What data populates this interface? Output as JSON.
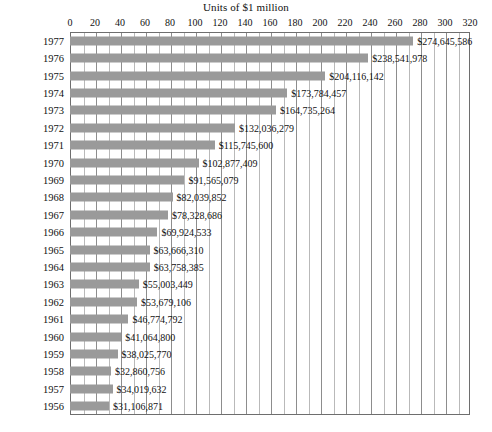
{
  "chart_data": {
    "type": "bar",
    "orientation": "horizontal",
    "title": "Units of $1 million",
    "xlabel": "",
    "ylabel": "",
    "xlim": [
      0,
      320
    ],
    "xticks": [
      0,
      20,
      40,
      60,
      80,
      100,
      120,
      140,
      160,
      180,
      200,
      220,
      240,
      260,
      280,
      300,
      320
    ],
    "minor_tick_step": 10,
    "grid": true,
    "legend": "none",
    "bar_color": "#9a9a9a",
    "categories": [
      "1977",
      "1976",
      "1975",
      "1974",
      "1973",
      "1972",
      "1971",
      "1970",
      "1969",
      "1968",
      "1967",
      "1966",
      "1965",
      "1964",
      "1963",
      "1962",
      "1961",
      "1960",
      "1959",
      "1958",
      "1957",
      "1956"
    ],
    "values": [
      274.645586,
      238.541978,
      204.116142,
      173.784457,
      164.735264,
      132.036279,
      115.7456,
      102.877409,
      91.565079,
      82.039852,
      78.328686,
      69.924533,
      63.66631,
      63.758385,
      55.003449,
      53.679106,
      46.774792,
      41.0648,
      38.02577,
      32.860756,
      34.019632,
      31.106871
    ],
    "data_labels": [
      "$274,645,586",
      "$238,541,978",
      "$204,116,142",
      "$173,784,457",
      "$164,735,264",
      "$132,036,279",
      "$115,745,600",
      "$102,877,409",
      "$91,565,079",
      "$82,039,852",
      "$78,328,686",
      "$69,924,533",
      "$63,666,310",
      "$63,758,385",
      "$55,003,449",
      "$53,679,106",
      "$46,774,792",
      "$41,064,800",
      "$38,025,770",
      "$32,860,756",
      "$34,019,632",
      "$31,106,871"
    ],
    "rows": [
      {
        "year": "1977",
        "value": 274.645586,
        "label": "$274,645,586"
      },
      {
        "year": "1976",
        "value": 238.541978,
        "label": "$238,541,978"
      },
      {
        "year": "1975",
        "value": 204.116142,
        "label": "$204,116,142"
      },
      {
        "year": "1974",
        "value": 173.784457,
        "label": "$173,784,457"
      },
      {
        "year": "1973",
        "value": 164.735264,
        "label": "$164,735,264"
      },
      {
        "year": "1972",
        "value": 132.036279,
        "label": "$132,036,279"
      },
      {
        "year": "1971",
        "value": 115.7456,
        "label": "$115,745,600"
      },
      {
        "year": "1970",
        "value": 102.877409,
        "label": "$102,877,409"
      },
      {
        "year": "1969",
        "value": 91.565079,
        "label": "$91,565,079"
      },
      {
        "year": "1968",
        "value": 82.039852,
        "label": "$82,039,852"
      },
      {
        "year": "1967",
        "value": 78.328686,
        "label": "$78,328,686"
      },
      {
        "year": "1966",
        "value": 69.924533,
        "label": "$69,924,533"
      },
      {
        "year": "1965",
        "value": 63.66631,
        "label": "$63,666,310"
      },
      {
        "year": "1964",
        "value": 63.758385,
        "label": "$63,758,385"
      },
      {
        "year": "1963",
        "value": 55.003449,
        "label": "$55,003,449"
      },
      {
        "year": "1962",
        "value": 53.679106,
        "label": "$53,679,106"
      },
      {
        "year": "1961",
        "value": 46.774792,
        "label": "$46,774,792"
      },
      {
        "year": "1960",
        "value": 41.0648,
        "label": "$41,064,800"
      },
      {
        "year": "1959",
        "value": 38.02577,
        "label": "$38,025,770"
      },
      {
        "year": "1958",
        "value": 32.860756,
        "label": "$32,860,756"
      },
      {
        "year": "1957",
        "value": 34.019632,
        "label": "$34,019,632"
      },
      {
        "year": "1956",
        "value": 31.106871,
        "label": "$31,106,871"
      }
    ]
  }
}
